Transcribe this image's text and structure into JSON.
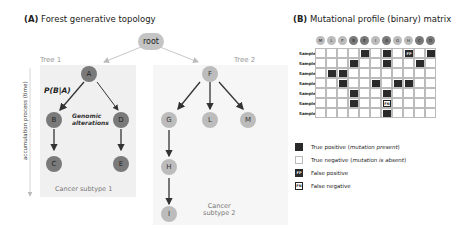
{
  "panel_a": {
    "label": "(A)",
    "title": "Forest generative topology",
    "root_label": "root",
    "axis_label": "accumulation process (time)",
    "tree1": {
      "label": "Tree 1",
      "subtype": "Cancer subtype 1",
      "edge_label": "P(B|A)",
      "annotation_line1": "Genomic",
      "annotation_line2": "alterations",
      "nodes": [
        "A",
        "B",
        "C",
        "D",
        "E"
      ]
    },
    "tree2": {
      "label": "Tree 2",
      "subtype_line1": "Cancer",
      "subtype_line2": "subtype 2",
      "nodes": [
        "F",
        "G",
        "L",
        "M",
        "H",
        "I"
      ]
    },
    "colors": {
      "tree1_node": "#7a7a7a",
      "tree2_node": "#bcbcbc",
      "tree_bg": "#f0f0f0"
    }
  },
  "panel_b": {
    "label": "(B)",
    "title": "Mutational profile (binary) matrix",
    "columns": [
      {
        "name": "M",
        "tree": 2
      },
      {
        "name": "L",
        "tree": 2
      },
      {
        "name": "F",
        "tree": 2
      },
      {
        "name": "B",
        "tree": 1
      },
      {
        "name": "E",
        "tree": 1
      },
      {
        "name": "I",
        "tree": 2
      },
      {
        "name": "A",
        "tree": 1
      },
      {
        "name": "G",
        "tree": 2
      },
      {
        "name": "H",
        "tree": 2
      },
      {
        "name": "C",
        "tree": 1
      },
      {
        "name": "D",
        "tree": 1
      }
    ],
    "rows": [
      {
        "label": "Sample 1",
        "cells": [
          "",
          "",
          "",
          "",
          "TP",
          "",
          "TP",
          "",
          "FP",
          "",
          "TP"
        ]
      },
      {
        "label": "Sample 2",
        "cells": [
          "",
          "",
          "",
          "TP",
          "",
          "",
          "TP",
          "",
          "",
          "TP",
          ""
        ]
      },
      {
        "label": "Sample 3",
        "cells": [
          "",
          "TP",
          "TP",
          "",
          "",
          "",
          "",
          "",
          "",
          "",
          ""
        ]
      },
      {
        "label": "Sample 4",
        "cells": [
          "",
          "",
          "TP",
          "",
          "",
          "TP",
          "",
          "TP",
          "TP",
          "",
          ""
        ]
      },
      {
        "label": "Sample 5",
        "cells": [
          "",
          "",
          "",
          "TP",
          "",
          "",
          "TP",
          "",
          "",
          "",
          ""
        ]
      },
      {
        "label": "Sample 6",
        "cells": [
          "",
          "",
          "",
          "TP",
          "",
          "",
          "FN",
          "",
          "",
          "",
          ""
        ]
      },
      {
        "label": "Sample 7",
        "cells": [
          "",
          "",
          "",
          "",
          "",
          "",
          "TP",
          "",
          "",
          "",
          ""
        ]
      }
    ],
    "legend": [
      {
        "key": "TP",
        "swatch": "",
        "text": "True positive (",
        "em": "mutation present",
        "tail": ")"
      },
      {
        "key": "TN",
        "swatch": "",
        "text": "True negative (",
        "em": "mutation is absent",
        "tail": ")"
      },
      {
        "key": "FP",
        "swatch": "FP",
        "text": "False positive",
        "em": "",
        "tail": ""
      },
      {
        "key": "FN",
        "swatch": "FN",
        "text": "False negative",
        "em": "",
        "tail": ""
      }
    ],
    "colors": {
      "present": "#2a2a2a",
      "absent": "#ffffff",
      "grid": "#bbbbbb"
    }
  }
}
